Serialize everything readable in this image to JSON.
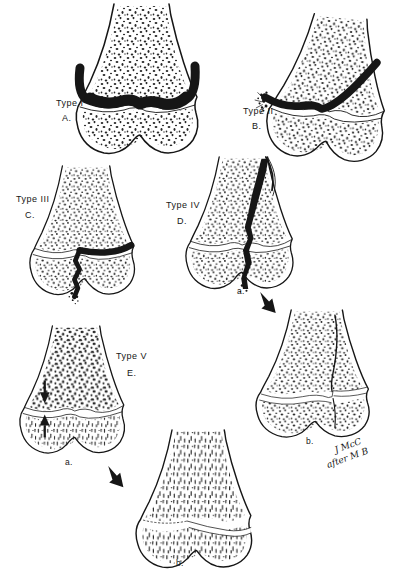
{
  "figure_kind": "epiphyseal-fracture-classification-illustration",
  "colors": {
    "ink": "#161616",
    "paper": "#ffffff"
  },
  "panels": [
    {
      "type_label": "Type I",
      "letter": "A."
    },
    {
      "type_label": "Type II",
      "letter": "B."
    },
    {
      "type_label": "Type III",
      "letter": "C."
    },
    {
      "type_label": "Type IV",
      "letter": "D.",
      "sub_a": "a.",
      "sub_b": "b."
    },
    {
      "type_label": "Type V",
      "letter": "E.",
      "sub_a": "a.",
      "sub_b": "b."
    }
  ],
  "signature": {
    "line1": "J McC",
    "line2": "after M B"
  }
}
